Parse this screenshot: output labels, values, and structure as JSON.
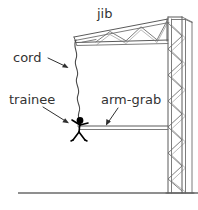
{
  "diagram": {
    "title_visible": false,
    "canvas": {
      "width": 198,
      "height": 210
    },
    "colors": {
      "background": "#ffffff",
      "structure_stroke": "#5a5a5a",
      "ground_stroke": "#6a6a6a",
      "cord_stroke": "#4a4a4a",
      "figure_fill": "#000000",
      "leader_stroke": "#2f2f2f",
      "label_text": "#333333"
    },
    "labels": {
      "jib": "jib",
      "cord": "cord",
      "trainee": "trainee",
      "arm_grab": "arm-grab"
    },
    "parts": {
      "jib_truss": "jib-truss",
      "mast_tower": "mast-lattice-tower",
      "arm_grab_beam": "arm-grab-beam",
      "cord": "suspended-cord",
      "trainee_figure": "trainee-stick-figure",
      "ground": "ground-line"
    }
  }
}
